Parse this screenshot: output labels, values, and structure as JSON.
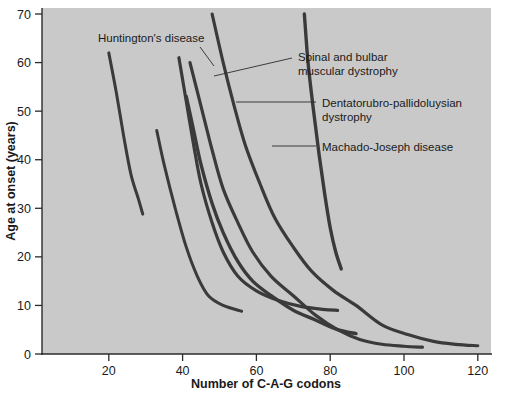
{
  "chart_data": {
    "type": "line",
    "title": "",
    "xlabel": "Number of C-A-G codons",
    "ylabel": "Age at onset (years)",
    "xlim": [
      0,
      126
    ],
    "ylim": [
      0,
      70
    ],
    "xticks": [
      20,
      40,
      60,
      80,
      100,
      120
    ],
    "yticks": [
      0,
      10,
      20,
      30,
      40,
      50,
      60,
      70
    ],
    "grid": false,
    "legend_position": "inline-annotations",
    "plot_background": "#c9c9c9",
    "curve_color": "#3a3a3a",
    "series": [
      {
        "name": "Huntington's disease",
        "stroke_width": 3.0,
        "points": [
          [
            20,
            62
          ],
          [
            22,
            54
          ],
          [
            24,
            45
          ],
          [
            26,
            37
          ],
          [
            28,
            32
          ],
          [
            29.2,
            28.8
          ]
        ]
      },
      {
        "name": "curve-2",
        "stroke_width": 3.0,
        "points": [
          [
            33,
            46
          ],
          [
            35,
            39
          ],
          [
            38,
            30
          ],
          [
            41,
            22
          ],
          [
            44,
            16
          ],
          [
            47,
            12
          ],
          [
            51,
            10
          ],
          [
            56,
            8.8
          ]
        ]
      },
      {
        "name": "curve-3",
        "stroke_width": 3.2,
        "points": [
          [
            39,
            61
          ],
          [
            41,
            52
          ],
          [
            43,
            43
          ],
          [
            45,
            35
          ],
          [
            48,
            27
          ],
          [
            51,
            21
          ],
          [
            55,
            16
          ],
          [
            60,
            13
          ],
          [
            66,
            11
          ],
          [
            72,
            9.8
          ],
          [
            78,
            9.2
          ],
          [
            82,
            9.0
          ]
        ]
      },
      {
        "name": "curve-4",
        "stroke_width": 3.4,
        "points": [
          [
            41,
            53
          ],
          [
            43,
            46
          ],
          [
            45,
            39
          ],
          [
            48,
            31
          ],
          [
            51,
            25
          ],
          [
            55,
            19
          ],
          [
            59,
            15
          ],
          [
            64,
            12
          ],
          [
            70,
            9
          ],
          [
            76,
            7
          ],
          [
            82,
            5
          ],
          [
            87,
            4.2
          ]
        ]
      },
      {
        "name": "curve-5",
        "stroke_width": 3.2,
        "points": [
          [
            42,
            60
          ],
          [
            45,
            51
          ],
          [
            48,
            42
          ],
          [
            51,
            34
          ],
          [
            55,
            27
          ],
          [
            59,
            21
          ],
          [
            64,
            16
          ],
          [
            70,
            12
          ],
          [
            76,
            8
          ],
          [
            82,
            5
          ],
          [
            88,
            3
          ],
          [
            94,
            2
          ],
          [
            100,
            1.6
          ],
          [
            105,
            1.4
          ]
        ]
      },
      {
        "name": "curve-6",
        "stroke_width": 3.2,
        "points": [
          [
            48,
            70
          ],
          [
            51,
            60
          ],
          [
            54,
            51
          ],
          [
            57,
            43
          ],
          [
            61,
            35
          ],
          [
            65,
            28
          ],
          [
            70,
            22
          ],
          [
            75,
            17
          ],
          [
            81,
            13
          ],
          [
            87,
            10
          ],
          [
            94,
            6
          ],
          [
            101,
            4
          ],
          [
            108,
            2.6
          ],
          [
            114,
            2.0
          ],
          [
            120,
            1.7
          ]
        ]
      },
      {
        "name": "curve-7",
        "stroke_width": 3.4,
        "points": [
          [
            73,
            70
          ],
          [
            74,
            60
          ],
          [
            75.5,
            50
          ],
          [
            77,
            41
          ],
          [
            78.5,
            33
          ],
          [
            80,
            26
          ],
          [
            81.5,
            21
          ],
          [
            83,
            17.5
          ]
        ]
      }
    ],
    "annotations": [
      {
        "label": "Huntington's disease",
        "lines": [
          "Huntington's disease"
        ],
        "text_x": 98,
        "text_y": 42,
        "anchor": "start",
        "leader": [
          [
            200,
            47
          ],
          [
            214,
            66
          ]
        ]
      },
      {
        "label": "Spinal and bulbar muscular dystrophy",
        "lines": [
          "Spinal and bulbar",
          "muscular dystrophy"
        ],
        "text_x": 298,
        "text_y": 61,
        "anchor": "start",
        "leader": [
          [
            292,
            58
          ],
          [
            214,
            76
          ]
        ]
      },
      {
        "label": "Dentatorubro-pallidoluysian dystrophy",
        "lines": [
          "Dentatorubro-pallidoluysian",
          "dystrophy"
        ],
        "text_x": 322,
        "text_y": 107,
        "anchor": "start",
        "leader": [
          [
            316,
            102
          ],
          [
            236,
            102
          ]
        ]
      },
      {
        "label": "Machado-Joseph disease",
        "lines": [
          "Machado-Joseph disease"
        ],
        "text_x": 322,
        "text_y": 151,
        "anchor": "start",
        "leader": [
          [
            316,
            146
          ],
          [
            272,
            146
          ]
        ]
      }
    ]
  }
}
